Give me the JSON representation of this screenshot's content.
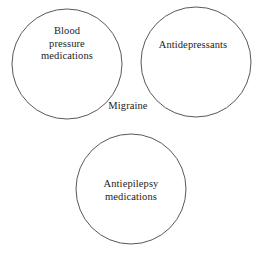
{
  "figure": {
    "type": "venn-diagram",
    "background_color": "#ffffff",
    "stroke_color": "#595959",
    "text_color": "#1c1c1c",
    "width": 253,
    "height": 253
  },
  "sets": [
    {
      "id": "blood-pressure-medications",
      "label": "Blood\npressure\nmedications",
      "center_x": 67,
      "center_y": 64,
      "radius": 55
    },
    {
      "id": "antidepressants",
      "label": "Antidepressants",
      "center_x": 196,
      "center_y": 62,
      "radius": 55
    },
    {
      "id": "antiepilepsy-medications",
      "label": "Antiepilepsy\nmedications",
      "center_x": 131,
      "center_y": 189,
      "radius": 55
    }
  ],
  "intersection": {
    "id": "migraine",
    "label": "Migraine"
  }
}
